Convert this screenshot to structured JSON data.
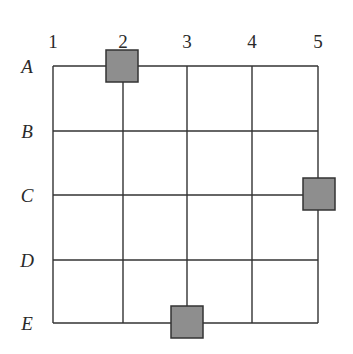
{
  "diagram": {
    "type": "grid",
    "columns": [
      "1",
      "2",
      "3",
      "4",
      "5"
    ],
    "rows": [
      "A",
      "B",
      "C",
      "D",
      "E"
    ],
    "grid_x": [
      53,
      123,
      187,
      252,
      318
    ],
    "grid_y": [
      66,
      131,
      195,
      260,
      323
    ],
    "line_color": "#333333",
    "markers": [
      {
        "row": "A",
        "col": "2",
        "cx": 122,
        "cy": 66
      },
      {
        "row": "C",
        "col": "5",
        "cx": 319,
        "cy": 194
      },
      {
        "row": "E",
        "col": "3",
        "cx": 187,
        "cy": 322
      }
    ],
    "marker_size": 32,
    "marker_fill": "#8e8e8e",
    "marker_stroke": "#333333"
  }
}
